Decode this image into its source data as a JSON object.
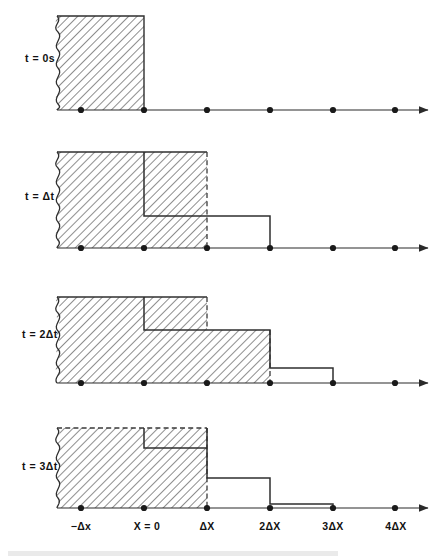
{
  "figure": {
    "background_color": "#ffffff",
    "line_color": "#2f2f2f",
    "hatch_color": "#4a4a4a",
    "axis_color": "#2a2a2a"
  },
  "axis": {
    "name": "x-axis",
    "tick_labels": [
      "−Δx",
      "X = 0",
      "ΔX",
      "2ΔX",
      "3ΔX",
      "4ΔX"
    ],
    "tick_positions_px": [
      81,
      144,
      207,
      270,
      333,
      395
    ],
    "arrow_end_px": 428,
    "spacing_px": 63,
    "has_arrowhead": true
  },
  "panels": [
    {
      "id": "panel-t0",
      "time_label": "t = 0s",
      "time_index": 0,
      "baseline_y": 110,
      "top_y": 16,
      "left_wavy_x": 57,
      "description": "Uniform filled block from the left boundary to X = 0; zero everywhere to the right.",
      "levels": [
        {
          "from": "-Δx",
          "to": "X = 0",
          "height": 1.0,
          "hatched": true
        },
        {
          "from": "X = 0",
          "to": "4ΔX",
          "height": 0.0,
          "hatched": false
        }
      ],
      "dashed_edges": [],
      "solid_step_path": ""
    },
    {
      "id": "panel-t1",
      "time_label": "t = Δt",
      "time_index": 1,
      "baseline_y": 248,
      "top_y": 152,
      "left_wavy_x": 57,
      "description": "Block has spread one cell: hatching reaches ΔX with a dashed right edge; the solid profile steps down at X = 0 and again at 2ΔX.",
      "levels": [
        {
          "from": "-Δx",
          "to": "X = 0",
          "height": 1.0,
          "hatched": true
        },
        {
          "from": "X = 0",
          "to": "ΔX",
          "height": 0.34,
          "hatched": true
        },
        {
          "from": "ΔX",
          "to": "2ΔX",
          "height": 0.34,
          "hatched": false
        },
        {
          "from": "2ΔX",
          "to": "4ΔX",
          "height": 0.0,
          "hatched": false
        }
      ],
      "dashed_edges": [
        "ΔX"
      ],
      "solid_step_path": "step down at X = 0 to 0.34, across to 2ΔX, down to baseline"
    },
    {
      "id": "panel-t2",
      "time_label": "t = 2Δt",
      "time_index": 2,
      "baseline_y": 383,
      "top_y": 297,
      "left_wavy_x": 57,
      "description": "Two-level staircase: full height to X = 0, a mid level from X = 0 to ΔX, a low level from ΔX to 2ΔX, then zero.",
      "levels": [
        {
          "from": "-Δx",
          "to": "X = 0",
          "height": 1.0,
          "hatched": true
        },
        {
          "from": "X = 0",
          "to": "ΔX",
          "height": 1.0,
          "hatched": true
        },
        {
          "from": "ΔX",
          "to": "2ΔX",
          "height": 0.55,
          "hatched": true
        },
        {
          "from": "2ΔX",
          "to": "3ΔX",
          "height": 0.16,
          "hatched": false
        },
        {
          "from": "3ΔX",
          "to": "4ΔX",
          "height": 0.0,
          "hatched": false
        }
      ],
      "dashed_edges": [
        "ΔX",
        "2ΔX"
      ],
      "solid_step_path": "down at X = 0 to 0.55, across to 2ΔX, down to 0.16, across to 3ΔX, down to baseline"
    },
    {
      "id": "panel-t3",
      "time_label": "t = 3Δt",
      "time_index": 3,
      "baseline_y": 508,
      "top_y": 428,
      "left_wavy_x": 57,
      "description": "Profile nearly flat on top out to ΔX with only a shallow notch at X = 0, then a low shelf to 2ΔX and a thin sliver to 3ΔX.",
      "levels": [
        {
          "from": "-Δx",
          "to": "X = 0",
          "height": 1.0,
          "hatched": true
        },
        {
          "from": "X = 0",
          "to": "ΔX",
          "height": 0.88,
          "hatched": true
        },
        {
          "from": "ΔX",
          "to": "2ΔX",
          "height": 0.24,
          "hatched": false
        },
        {
          "from": "2ΔX",
          "to": "3ΔX",
          "height": 0.03,
          "hatched": false
        },
        {
          "from": "3ΔX",
          "to": "4ΔX",
          "height": 0.0,
          "hatched": false
        }
      ],
      "dashed_edges": [
        "X = 0",
        "ΔX"
      ],
      "solid_step_path": "shallow notch at X = 0, full height to ΔX, down to 0.24, across to 2ΔX, down to 0.03 sliver to 3ΔX, then baseline"
    }
  ],
  "caption": {
    "visible": false,
    "text": ""
  }
}
